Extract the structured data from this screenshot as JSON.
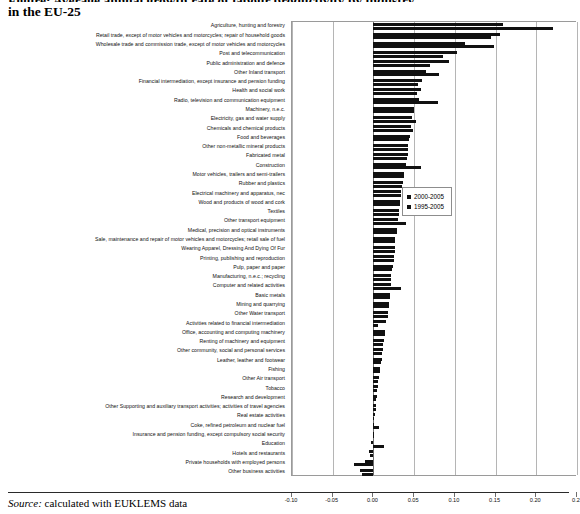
{
  "title": {
    "line1": "Figure: Average annual growth rate of labour productivity by industry",
    "line2": "in the EU-25"
  },
  "footer": {
    "source_word": "Source:",
    "source_text": " calculated with EUKLEMS data"
  },
  "legend": {
    "position": "inside-right",
    "items": [
      {
        "label": "2000-2005",
        "color": "#111111"
      },
      {
        "label": "1995-2005",
        "color": "#111111"
      }
    ]
  },
  "chart_data": {
    "type": "bar",
    "orientation": "horizontal",
    "title": "Figure: Average annual growth rate of labour productivity by industry in the EU-25",
    "xlabel": "",
    "ylabel": "",
    "xlim": [
      -0.1,
      0.25
    ],
    "xticks": [
      -0.1,
      -0.05,
      0.0,
      0.05,
      0.1,
      0.15,
      0.2,
      0.25
    ],
    "xtick_labels": [
      "-0.10",
      "-0.05",
      "0.00",
      "0.05",
      "0.10",
      "0.15",
      "0.20",
      "0.2"
    ],
    "grid": true,
    "grid_axis": "x",
    "legend_position": "inside-right",
    "categories": [
      "Agriculture, hunting and forestry",
      "Retail trade, except of motor vehicles and motorcycles; repair of household goods",
      "Wholesale trade and commission trade, except of motor vehicles and motorcycles",
      "Post and telecommunication",
      "Public administration and defence",
      "Other Inland transport",
      "Financial intermediation, except insurance and pension funding",
      "Health and social work",
      "Radio, television and communication equipment",
      "Machinery, n.e.c.",
      "Electricity, gas and water supply",
      "Chemicals and chemical products",
      "Food and beverages",
      "Other non-metallic mineral products",
      "Fabricated metal",
      "Construction",
      "Motor vehicles, trailers and semi-trailers",
      "Rubber and plastics",
      "Electrical machinery and apparatus, nec",
      "Wood and products of wood and cork",
      "Textiles",
      "Other transport equipment",
      "Medical, precision and optical instruments",
      "Sale, maintenance and repair of motor vehicles and motorcycles; retail sale of fuel",
      "Wearing Apparel, Dressing And Dying Of Fur",
      "Printing, publishing and reproduction",
      "Pulp, paper and paper",
      "Manufacturing, n.e.c.; recycling",
      "Computer and related activities",
      "Basic metals",
      "Mining and quarrying",
      "Other Water transport",
      "Activities related to financial intermediation",
      "Office, accounting and computing machinery",
      "Renting of machinery and equipment",
      "Other community, social and personal services",
      "Leather, leather and footwear",
      "Fishing",
      "Other Air transport",
      "Tobacco",
      "Research and development",
      "Other Supporting and auxiliary transport activities; activities of travel agencies",
      "Real estate activities",
      "Coke, refined petroleum and nuclear fuel",
      "Insurance and pension funding, except compulsory social security",
      "Education",
      "Hotels and restaurants",
      "Private households with employed persons",
      "Other business activities"
    ],
    "series": [
      {
        "name": "2000-2005",
        "values": [
          0.159,
          0.155,
          0.112,
          0.103,
          0.093,
          0.064,
          0.06,
          0.058,
          0.056,
          0.05,
          0.047,
          0.046,
          0.045,
          0.043,
          0.042,
          0.04,
          0.038,
          0.036,
          0.034,
          0.033,
          0.032,
          0.03,
          0.029,
          0.027,
          0.026,
          0.025,
          0.024,
          0.022,
          0.021,
          0.02,
          0.019,
          0.018,
          0.016,
          0.014,
          0.013,
          0.012,
          0.01,
          0.008,
          0.007,
          0.006,
          0.004,
          0.003,
          0.002,
          0.001,
          -0.001,
          -0.003,
          -0.006,
          -0.01,
          -0.016
        ]
      },
      {
        "name": "1995-2005",
        "values": [
          0.22,
          0.145,
          0.148,
          0.085,
          0.07,
          0.08,
          0.055,
          0.053,
          0.079,
          0.05,
          0.052,
          0.048,
          0.044,
          0.043,
          0.041,
          0.059,
          0.037,
          0.035,
          0.034,
          0.033,
          0.031,
          0.04,
          0.029,
          0.026,
          0.026,
          0.025,
          0.023,
          0.022,
          0.034,
          0.02,
          0.019,
          0.018,
          0.006,
          0.014,
          0.012,
          0.011,
          0.009,
          0.008,
          0.006,
          0.005,
          0.003,
          0.003,
          0.001,
          0.007,
          -0.001,
          0.013,
          -0.004,
          -0.024,
          -0.014
        ]
      }
    ]
  }
}
